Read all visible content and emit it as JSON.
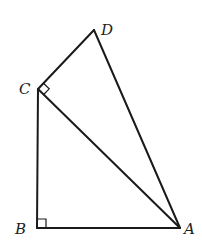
{
  "diagram": {
    "type": "geometry",
    "points": {
      "A": {
        "label": "A",
        "x": 180,
        "y": 228
      },
      "B": {
        "label": "B",
        "x": 37,
        "y": 228
      },
      "C": {
        "label": "C",
        "x": 38,
        "y": 89
      },
      "D": {
        "label": "D",
        "x": 94,
        "y": 30
      }
    },
    "segments": [
      "AB",
      "BC",
      "CA",
      "CD",
      "DA"
    ],
    "right_angles": [
      "B",
      "C"
    ],
    "labels": {
      "A": "A",
      "B": "B",
      "C": "C",
      "D": "D"
    },
    "line_color": "#1a1a1a",
    "background": "#ffffff"
  }
}
